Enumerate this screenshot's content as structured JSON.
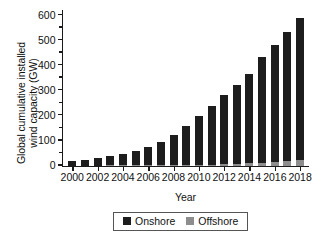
{
  "chart_data": {
    "type": "bar",
    "title": "",
    "xlabel": "Year",
    "ylabel": "Global cumulative installed wind capacity (GW)",
    "ylabel_lines": [
      "Global cumulative installed",
      "wind capacity (GW)"
    ],
    "stacked": true,
    "grid": false,
    "ylim": [
      0,
      620
    ],
    "yticks": [
      0,
      100,
      200,
      300,
      400,
      500,
      600
    ],
    "ytick_labels": [
      "0",
      "100",
      "200",
      "300",
      "400",
      "500",
      "600"
    ],
    "yminor_ticks": [
      50,
      150,
      250,
      350,
      450,
      550
    ],
    "xlim": [
      1999.3,
      2018.7
    ],
    "categories": [
      2000,
      2001,
      2002,
      2003,
      2004,
      2005,
      2006,
      2007,
      2008,
      2009,
      2010,
      2011,
      2012,
      2013,
      2014,
      2015,
      2016,
      2017,
      2018
    ],
    "xtick_labels": [
      "2000",
      "2002",
      "2004",
      "2006",
      "2008",
      "2010",
      "2012",
      "2014",
      "2016",
      "2018"
    ],
    "xticks": [
      2000,
      2002,
      2004,
      2006,
      2008,
      2010,
      2012,
      2014,
      2016,
      2018
    ],
    "series": [
      {
        "name": "Onshore",
        "color": "#1d1d1d",
        "values": [
          17,
          23,
          30,
          39,
          47,
          58,
          73,
          92,
          119,
          157,
          196,
          235,
          278,
          315,
          355,
          420,
          468,
          515,
          565
        ]
      },
      {
        "name": "Offshore",
        "color": "#8d8d8d",
        "values": [
          0,
          0,
          0,
          1,
          1,
          1,
          1,
          1,
          2,
          2,
          3,
          4,
          5,
          7,
          9,
          12,
          14,
          19,
          23
        ]
      }
    ],
    "totals": [
      17,
      23,
      30,
      40,
      48,
      59,
      74,
      93,
      121,
      159,
      199,
      239,
      283,
      322,
      364,
      432,
      482,
      534,
      588
    ],
    "legend": {
      "position": "bottom-center",
      "entries": [
        "Onshore",
        "Offshore"
      ]
    }
  }
}
